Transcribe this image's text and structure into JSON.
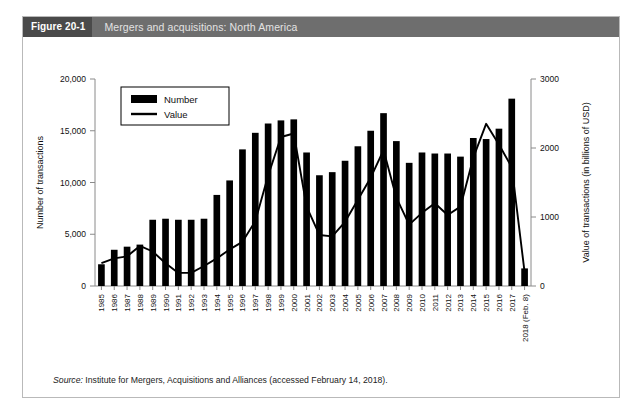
{
  "figure": {
    "number_label": "Figure 20-1",
    "title": "Mergers and acquisitions: North America",
    "source_prefix": "Source:",
    "source_text": " Institute for Mergers, Acquisitions and Alliances (accessed February 14, 2018)."
  },
  "colors": {
    "title_bar": "#6e6e6e",
    "title_badge": "#4a4a4a",
    "bar": "#000000",
    "line": "#000000",
    "frame": "#b9b9b9"
  },
  "chart_data": {
    "type": "bar",
    "title": "Mergers and acquisitions: North America",
    "xlabel": "",
    "ylabel": "Number of transactions",
    "y2label": "Value of transactions (in billions of USD)",
    "ylim": [
      0,
      20000
    ],
    "y2lim": [
      0,
      3000
    ],
    "yticks": [
      "0",
      "5,000",
      "10,000",
      "15,000",
      "20,000"
    ],
    "ytick_values": [
      0,
      5000,
      10000,
      15000,
      20000
    ],
    "y2ticks": [
      "0",
      "1000",
      "2000",
      "3000"
    ],
    "y2tick_values": [
      0,
      1000,
      2000,
      3000
    ],
    "grid": false,
    "legend_position": "upper-left",
    "categories": [
      "1985",
      "1986",
      "1987",
      "1988",
      "1989",
      "1990",
      "1991",
      "1992",
      "1993",
      "1994",
      "1995",
      "1996",
      "1997",
      "1998",
      "1999",
      "2000",
      "2001",
      "2002",
      "2003",
      "2004",
      "2005",
      "2006",
      "2007",
      "2008",
      "2009",
      "2010",
      "2011",
      "2012",
      "2013",
      "2014",
      "2015",
      "2016",
      "2017",
      "2018 (Feb. 8)"
    ],
    "series": [
      {
        "name": "Number",
        "axis": "left",
        "render": "bar",
        "values": [
          2100,
          3500,
          3800,
          4000,
          6400,
          6500,
          6400,
          6400,
          6500,
          8800,
          10200,
          13200,
          14800,
          15700,
          16000,
          16100,
          12900,
          10700,
          11000,
          12100,
          13500,
          15000,
          16700,
          14000,
          11900,
          12900,
          12800,
          12800,
          12500,
          14300,
          14200,
          15200,
          18100,
          1700
        ]
      },
      {
        "name": "Value",
        "axis": "right",
        "render": "line",
        "values": [
          330,
          400,
          430,
          580,
          500,
          330,
          190,
          190,
          290,
          400,
          530,
          640,
          940,
          1600,
          2160,
          2210,
          1150,
          740,
          720,
          930,
          1250,
          1570,
          1970,
          1280,
          890,
          1060,
          1200,
          1030,
          1150,
          1860,
          2350,
          2050,
          1720,
          200
        ]
      }
    ],
    "legend": [
      {
        "label": "Number",
        "marker": "filled-rect"
      },
      {
        "label": "Value",
        "marker": "line"
      }
    ],
    "annotations": []
  }
}
